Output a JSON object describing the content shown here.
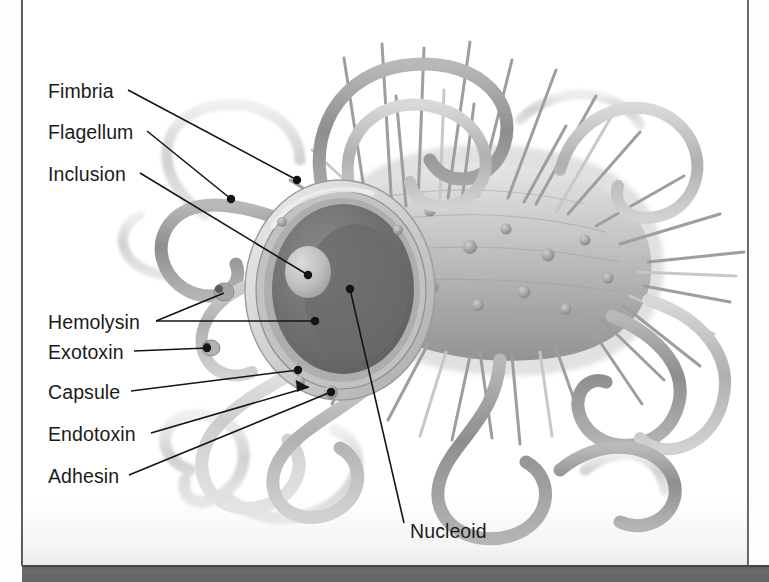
{
  "figure": {
    "type": "biology-illustration",
    "palette": {
      "background": "#ffffff",
      "ink": "#1b1b1b",
      "cell_body_light": "#cfcfcf",
      "cell_body_mid": "#a9a9a9",
      "cell_body_dark": "#7d7d7d",
      "cytoplasm_dark": "#6e6e6e",
      "inclusion_light": "#c4c4c4",
      "capsule_ring": "#d6d6d6",
      "flagella_gray": "#a3a3a3",
      "page_band_dark": "#666666"
    }
  },
  "labels": [
    {
      "id": "fimbria",
      "text": "Fimbria",
      "x": 48,
      "y": 97,
      "anchor_x": 128,
      "anchor_y": 90,
      "tip_x": 297,
      "tip_y": 180
    },
    {
      "id": "flagellum",
      "text": "Flagellum",
      "x": 48,
      "y": 138,
      "anchor_x": 147,
      "anchor_y": 131,
      "tip_x": 231,
      "tip_y": 199
    },
    {
      "id": "inclusion",
      "text": "Inclusion",
      "x": 48,
      "y": 180,
      "anchor_x": 140,
      "anchor_y": 173,
      "tip_x": 308,
      "tip_y": 275
    },
    {
      "id": "hemolysin",
      "text": "Hemolysin",
      "x": 48,
      "y": 328,
      "anchor_x": 156,
      "anchor_y": 321,
      "tip_x": 315,
      "tip_y": 321
    },
    {
      "id": "exotoxin",
      "text": "Exotoxin",
      "x": 48,
      "y": 358,
      "anchor_x": 134,
      "anchor_y": 351,
      "tip_x": 207,
      "tip_y": 348
    },
    {
      "id": "capsule",
      "text": "Capsule",
      "x": 48,
      "y": 398,
      "anchor_x": 131,
      "anchor_y": 391,
      "tip_x": 298,
      "tip_y": 370
    },
    {
      "id": "endotoxin",
      "text": "Endotoxin",
      "x": 48,
      "y": 440,
      "anchor_x": 151,
      "anchor_y": 433,
      "tip_x": 309,
      "tip_y": 387
    },
    {
      "id": "adhesin",
      "text": "Adhesin",
      "x": 48,
      "y": 482,
      "anchor_x": 129,
      "anchor_y": 475,
      "tip_x": 331,
      "tip_y": 392
    },
    {
      "id": "nucleoid",
      "text": "Nucleoid",
      "x": 410,
      "y": 537,
      "anchor_x": 404,
      "anchor_y": 523,
      "tip_x": 350,
      "tip_y": 289
    }
  ],
  "structures": [
    {
      "name": "capsule",
      "description": "outer light ring surrounding the cell cross-section"
    },
    {
      "name": "cell-wall",
      "description": "layered ring inside the capsule"
    },
    {
      "name": "cytoplasm",
      "description": "dark granular interior of the cut face"
    },
    {
      "name": "nucleoid",
      "description": "dense region within the cytoplasm"
    },
    {
      "name": "inclusion",
      "description": "pale rounded granule inside the cytoplasm"
    },
    {
      "name": "fimbriae",
      "description": "numerous short straight hair-like projections"
    },
    {
      "name": "flagella",
      "description": "long thick wavy filaments looping around the cell"
    },
    {
      "name": "hemolysin",
      "description": "small secreted molecule shown as a knobbed particle"
    },
    {
      "name": "exotoxin",
      "description": "small secreted molecule shown as a knobbed particle"
    },
    {
      "name": "endotoxin",
      "description": "component embedded in the outer membrane"
    },
    {
      "name": "adhesin",
      "description": "knob on the cell surface used for attachment"
    }
  ]
}
